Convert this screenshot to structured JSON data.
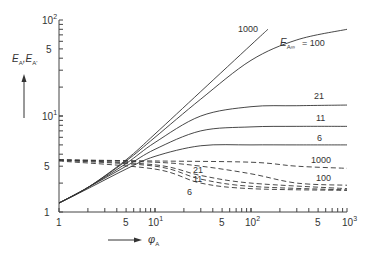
{
  "chart_data": {
    "type": "line",
    "title": "",
    "xlabel": "φ_A",
    "ylabel": "E_A, E_A'",
    "xscale": "log",
    "yscale": "log",
    "xlim": [
      1,
      1000
    ],
    "ylim": [
      1,
      100
    ],
    "x_ticks": [
      "1",
      "5",
      "10^1",
      "5",
      "10^2",
      "5",
      "10^3"
    ],
    "y_ticks": [
      "1",
      "5",
      "10^1",
      "5",
      "10^2"
    ],
    "grid": false,
    "annotations": [
      "E_A∞ = 100",
      "1000",
      "21",
      "11",
      "6"
    ],
    "series": [
      {
        "name": "E_A (E_A∞=1000)",
        "style": "solid",
        "label": "1000",
        "x": [
          1,
          2,
          5,
          10,
          30,
          100,
          150
        ],
        "y": [
          1.24,
          1.8,
          3.5,
          6.5,
          18,
          55,
          80
        ]
      },
      {
        "name": "E_A (E_A∞=100)",
        "style": "solid",
        "label": "E_A∞ = 100",
        "x": [
          1,
          2,
          5,
          10,
          30,
          100,
          300,
          1000
        ],
        "y": [
          1.24,
          1.8,
          3.4,
          6.0,
          15,
          38,
          62,
          80
        ]
      },
      {
        "name": "E_A (E_A∞=21)",
        "style": "solid",
        "label": "21",
        "x": [
          1,
          2,
          5,
          10,
          30,
          100,
          300,
          1000
        ],
        "y": [
          1.24,
          1.8,
          3.2,
          5.3,
          10,
          12.5,
          12.8,
          13.0
        ]
      },
      {
        "name": "E_A (E_A∞=11)",
        "style": "solid",
        "label": "11",
        "x": [
          1,
          2,
          5,
          10,
          30,
          100,
          300,
          1000
        ],
        "y": [
          1.24,
          1.8,
          3.0,
          4.5,
          7.0,
          7.7,
          7.8,
          7.8
        ]
      },
      {
        "name": "E_A (E_A∞=6)",
        "style": "solid",
        "label": "6",
        "x": [
          1,
          2,
          5,
          10,
          30,
          100,
          300,
          1000
        ],
        "y": [
          1.24,
          1.75,
          2.8,
          3.8,
          4.9,
          5.0,
          5.0,
          5.0
        ]
      },
      {
        "name": "E_A' (E_A∞=1000)",
        "style": "dashed",
        "label": "1000",
        "x": [
          1,
          10,
          100,
          300,
          1000
        ],
        "y": [
          3.5,
          3.4,
          3.3,
          3.0,
          2.85
        ]
      },
      {
        "name": "E_A' (E_A∞=100)",
        "style": "dashed",
        "label": "100",
        "x": [
          1,
          10,
          30,
          100,
          300,
          1000
        ],
        "y": [
          3.5,
          3.3,
          3.0,
          2.5,
          2.0,
          1.9
        ]
      },
      {
        "name": "E_A' (E_A∞=21)",
        "style": "dashed",
        "label": "21",
        "x": [
          1,
          10,
          30,
          100,
          1000
        ],
        "y": [
          3.5,
          3.1,
          2.4,
          2.0,
          1.75
        ]
      },
      {
        "name": "E_A' (E_A∞=11)",
        "style": "dashed",
        "label": "11",
        "x": [
          1,
          10,
          30,
          100,
          1000
        ],
        "y": [
          3.45,
          3.0,
          2.2,
          1.85,
          1.7
        ]
      },
      {
        "name": "E_A' (E_A∞=6)",
        "style": "dashed",
        "label": "6",
        "x": [
          1,
          10,
          30,
          100,
          1000
        ],
        "y": [
          3.4,
          2.8,
          2.0,
          1.75,
          1.68
        ]
      }
    ]
  },
  "labels": {
    "y_axis": "E",
    "y_sub1": "A",
    "y_sep": ",E",
    "y_sub2": "A'",
    "x_axis": "φ",
    "x_sub": "A",
    "e_inf": "E",
    "e_inf_sub": "A∞",
    "e_inf_val": "= 100",
    "l1000": "1000",
    "l21": "21",
    "l11": "11",
    "l6": "6",
    "d1000": "1000",
    "d100": "100",
    "d21": "21",
    "d11": "11",
    "d6": "6",
    "yt_1": "1",
    "yt_5a": "5",
    "yt_10": "10",
    "yt_10e": "1",
    "yt_5b": "5",
    "yt_100": "10",
    "yt_100e": "2",
    "xt_1": "1",
    "xt_5a": "5",
    "xt_10": "10",
    "xt_10e": "1",
    "xt_5b": "5",
    "xt_100": "10",
    "xt_100e": "2",
    "xt_5c": "5",
    "xt_1000": "10",
    "xt_1000e": "3"
  }
}
